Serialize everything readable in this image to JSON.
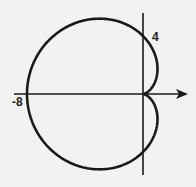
{
  "figure": {
    "type": "polar-curve",
    "labels": {
      "y_intercept": "4",
      "x_intercept": "-8"
    },
    "curve": {
      "a": 4,
      "form": "r = a - a cos(theta)"
    },
    "colors": {
      "stroke": "#1a1a1a",
      "background": "#f2f2f0"
    }
  }
}
